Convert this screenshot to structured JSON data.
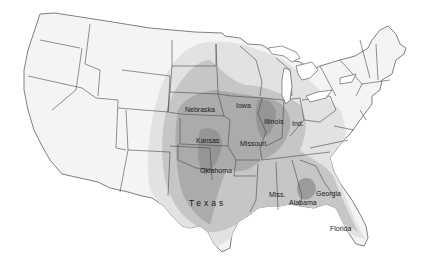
{
  "map": {
    "type": "choropleth",
    "region": "Contiguous United States",
    "style": "grayscale shaded zones",
    "legend": null,
    "shading_levels": [
      {
        "name": "lightest",
        "color": "#eeeeee"
      },
      {
        "name": "light",
        "color": "#d6d6d6"
      },
      {
        "name": "medium",
        "color": "#bcbcbc"
      },
      {
        "name": "dark",
        "color": "#a2a2a2"
      },
      {
        "name": "darkest",
        "color": "#8a8a8a"
      }
    ],
    "labels": [
      {
        "id": "nebraska",
        "text": "Nebraska"
      },
      {
        "id": "iowa",
        "text": "Iowa"
      },
      {
        "id": "illinois",
        "text": "Illinois"
      },
      {
        "id": "indiana",
        "text": "Ind."
      },
      {
        "id": "kansas",
        "text": "Kansas"
      },
      {
        "id": "missouri",
        "text": "Missouri"
      },
      {
        "id": "oklahoma",
        "text": "Oklahoma"
      },
      {
        "id": "texas",
        "text": "Texas"
      },
      {
        "id": "mississippi",
        "text": "Miss."
      },
      {
        "id": "alabama",
        "text": "Alabama"
      },
      {
        "id": "georgia",
        "text": "Georgia"
      },
      {
        "id": "florida",
        "text": "Florida"
      }
    ]
  }
}
